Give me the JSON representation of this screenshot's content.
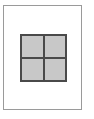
{
  "diagram": {
    "type": "page-layout-icon",
    "grid": {
      "rows": 2,
      "columns": 2,
      "fill_color": "#c8c8c8",
      "line_color": "#4a4a4a"
    },
    "page": {
      "border_color": "#9a9a9a",
      "background": "#ffffff"
    }
  }
}
